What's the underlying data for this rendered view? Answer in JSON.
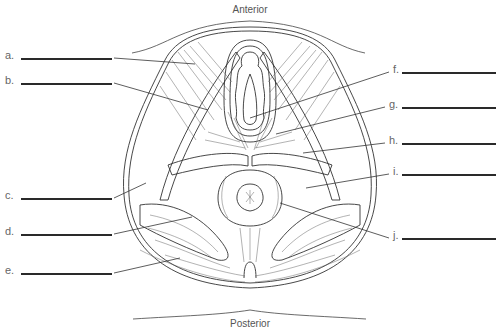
{
  "diagram": {
    "orientation": {
      "top": {
        "text": "Anterior",
        "x": 250,
        "y": 4
      },
      "bottom": {
        "text": "Posterior",
        "x": 250,
        "y": 318
      }
    },
    "labels": [
      {
        "id": "a",
        "text": "a.",
        "side": "left",
        "label_x": 5,
        "y": 58,
        "line_x1": 21,
        "line_x2": 112,
        "pointer_to": [
          195,
          64
        ]
      },
      {
        "id": "b",
        "text": "b.",
        "side": "left",
        "label_x": 5,
        "y": 83,
        "line_x1": 21,
        "line_x2": 112,
        "pointer_to": [
          208,
          110
        ]
      },
      {
        "id": "c",
        "text": "c.",
        "side": "left",
        "label_x": 5,
        "y": 198,
        "line_x1": 21,
        "line_x2": 112,
        "pointer_to": [
          146,
          183
        ]
      },
      {
        "id": "d",
        "text": "d.",
        "side": "left",
        "label_x": 5,
        "y": 234,
        "line_x1": 21,
        "line_x2": 112,
        "pointer_to": [
          192,
          217
        ]
      },
      {
        "id": "e",
        "text": "e.",
        "side": "left",
        "label_x": 5,
        "y": 273,
        "line_x1": 21,
        "line_x2": 112,
        "pointer_to": [
          180,
          258
        ]
      },
      {
        "id": "f",
        "text": "f.",
        "side": "right",
        "label_x": 393,
        "y": 72,
        "line_x1": 402,
        "line_x2": 496,
        "pointer_to": [
          250,
          118
        ]
      },
      {
        "id": "g",
        "text": "g.",
        "side": "right",
        "label_x": 389,
        "y": 107,
        "line_x1": 402,
        "line_x2": 496,
        "pointer_to": [
          276,
          134
        ]
      },
      {
        "id": "h",
        "text": "h.",
        "side": "right",
        "label_x": 389,
        "y": 143,
        "line_x1": 402,
        "line_x2": 496,
        "pointer_to": [
          303,
          153
        ]
      },
      {
        "id": "i",
        "text": "i.",
        "side": "right",
        "label_x": 393,
        "y": 174,
        "line_x1": 402,
        "line_x2": 496,
        "pointer_to": [
          306,
          188
        ]
      },
      {
        "id": "j",
        "text": "j.",
        "side": "right",
        "label_x": 393,
        "y": 238,
        "line_x1": 402,
        "line_x2": 496,
        "pointer_to": [
          280,
          203
        ]
      }
    ],
    "colors": {
      "ink": "#333333",
      "label_text": "#666666",
      "blank_line": "#2a2a2a",
      "background": "#ffffff"
    }
  }
}
